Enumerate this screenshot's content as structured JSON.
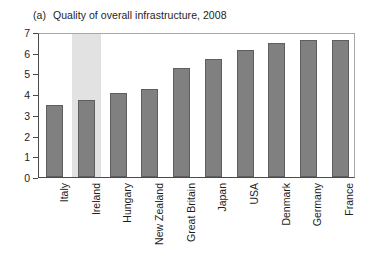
{
  "chart_data": {
    "type": "bar",
    "title": "Quality of overall infrastructure, 2008",
    "panel_label": "(a)",
    "xlabel": "",
    "ylabel": "",
    "ylim": [
      0,
      7
    ],
    "yticks": [
      0,
      1,
      2,
      3,
      4,
      5,
      6,
      7
    ],
    "ytick_labels": [
      "0",
      "1",
      "2",
      "3",
      "4",
      "5",
      "6",
      "7"
    ],
    "grid": false,
    "legend": "none",
    "categories": [
      "Italy",
      "Ireland",
      "Hungary",
      "New Zealand",
      "Great Britain",
      "Japan",
      "USA",
      "Denmark",
      "Germany",
      "France"
    ],
    "values": [
      3.5,
      3.7,
      4.05,
      4.25,
      5.25,
      5.7,
      6.15,
      6.45,
      6.6,
      6.6
    ],
    "highlighted_category": "Ireland",
    "colors": {
      "bar_fill": "#808080",
      "bar_edge": "#5e5e5e",
      "highlight_band": "#e2e2e2",
      "axis": "#4a4a4a",
      "frame": "#a8a8a8",
      "text": "#1d1d1d",
      "background": "#ffffff"
    }
  }
}
